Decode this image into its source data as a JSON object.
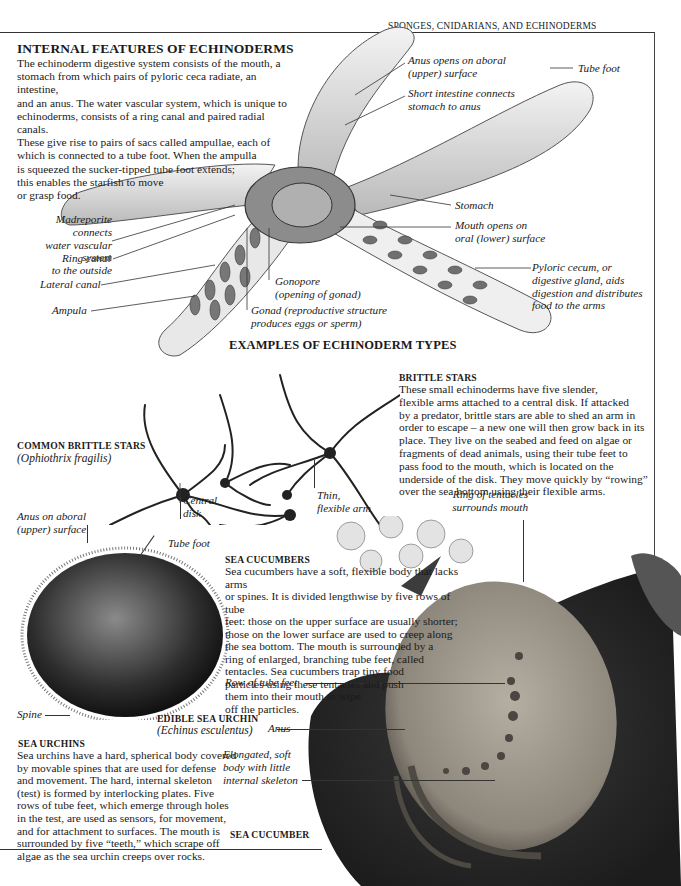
{
  "page": {
    "running_head": "SPONGES, CNIDARIANS, AND ECHINODERMS"
  },
  "internal_features": {
    "title": "INTERNAL FEATURES OF ECHINODERMS",
    "lines": [
      "The echinoderm digestive system consists of the mouth, a",
      "stomach from which pairs of pyloric ceca radiate, an intestine,",
      "and an anus. The water vascular system,  which is unique to",
      "echinoderms, consists of a ring canal and paired radial canals.",
      "These give rise to pairs of sacs called ampullae, each of",
      "which is connected to a tube foot. When the ampulla",
      "is squeezed the sucker-tipped tube foot extends;",
      "this enables the starfish to move",
      "or grasp food."
    ]
  },
  "starfish_labels": {
    "anus": [
      "Anus opens on aboral",
      "(upper) surface"
    ],
    "intestine": [
      "Short intestine connects",
      "stomach to anus"
    ],
    "tube_foot": "Tube foot",
    "madreporite": [
      "Madreporite connects",
      "water vascular system",
      "to the outside"
    ],
    "ring_canal": "Ring canal",
    "lateral_canal": "Lateral canal",
    "ampula": "Ampula",
    "gonopore": [
      "Gonopore",
      "(opening of gonad)"
    ],
    "gonad": [
      "Gonad (reproductive structure",
      "produces eggs or sperm)"
    ],
    "stomach": "Stomach",
    "mouth": [
      "Mouth opens on",
      "oral (lower) surface"
    ],
    "pyloric": [
      "Pyloric cecum, or",
      "digestive gland, aids",
      "digestion and distributes",
      "food to the arms"
    ]
  },
  "examples": {
    "title": "EXAMPLES OF ECHINODERM TYPES"
  },
  "brittle_stars": {
    "caption_title": "COMMON BRITTLE STARS",
    "caption_latin": "(Ophiothrix fragilis)",
    "central_disk": [
      "Central",
      "disk"
    ],
    "thin_arm": [
      "Thin,",
      "flexible arm"
    ],
    "title": "BRITTLE  STARS",
    "lines": [
      "These small echinoderms have five slender,",
      "flexible arms attached to a central disk. If attacked",
      "by a predator, brittle stars are able to shed an arm in",
      "order to escape – a new one will then grow back in its",
      "place. They live on the seabed and feed on algae or",
      "fragments of dead animals, using their tube feet to",
      "pass food to the mouth, which is located on the",
      "underside of the disk. They move quickly by “rowing”",
      "over the sea bottom using their flexible arms."
    ]
  },
  "sea_urchin": {
    "anus_label": [
      "Anus on aboral",
      "(upper) surface"
    ],
    "tube_foot": "Tube foot",
    "spine": "Spine",
    "caption_title": "EDIBLE SEA URCHIN",
    "caption_latin": "(Echinus esculentus)",
    "title": "SEA URCHINS",
    "lines": [
      "Sea urchins have a hard, spherical body covered",
      "by movable spines that are used for defense",
      "and movement. The hard, internal skeleton",
      "(test) is formed by interlocking plates. Five",
      "rows of tube feet, which emerge through holes",
      "in the test, are used as sensors, for movement,",
      "and for attachment to surfaces. The mouth is",
      "surrounded by five “teeth,” which scrape off",
      "algae as the sea urchin creeps over rocks."
    ]
  },
  "sea_cucumber": {
    "title": "SEA CUCUMBERS",
    "lines": [
      "Sea cucumbers have a soft, flexible body that lacks arms",
      "or spines. It is divided lengthwise by five rows of tube",
      "feet: those on the upper surface are usually shorter;",
      "those on the lower surface are used to creep along",
      "the sea bottom. The mouth is surrounded by a",
      "ring of enlarged, branching tube feet, called",
      "tentacles. Sea cucumbers trap tiny food",
      "particles using these tentacles and push",
      "them into their mouth to wipe",
      "off the particles."
    ],
    "tentacles_label": [
      "Ring of tentacles",
      "surrounds mouth"
    ],
    "row_label": "Row of tube feet",
    "anus_label": "Anus",
    "body_label": [
      "Elongated, soft",
      "body with little",
      "internal skeleton"
    ],
    "caption": "SEA CUCUMBER"
  }
}
